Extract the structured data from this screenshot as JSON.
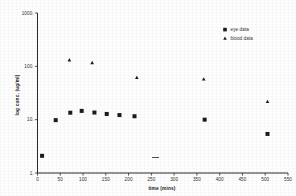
{
  "chart_data": {
    "type": "scatter",
    "title": "",
    "xlabel": "time (mins)",
    "ylabel": "log conc. (ug/ml)",
    "xlim": [
      0,
      550
    ],
    "ylim": [
      1,
      1000
    ],
    "yscale": "log",
    "grid": false,
    "legend_position": "top-right",
    "x_ticks": [
      0,
      50,
      100,
      150,
      200,
      250,
      300,
      350,
      400,
      450,
      500,
      550
    ],
    "x_tick_labels": [
      "0",
      "50",
      "100",
      "150",
      "200",
      "250",
      "300",
      "350",
      "400",
      "450",
      "500",
      "550"
    ],
    "y_ticks": [
      1,
      10,
      100,
      1000
    ],
    "y_tick_labels": [
      "1.",
      "10.",
      "100.",
      "1000."
    ],
    "series": [
      {
        "name": "eye data",
        "marker": "square",
        "color": "#1c1c1c",
        "points": [
          {
            "x": 10,
            "y": 2.1
          },
          {
            "x": 40,
            "y": 9.8
          },
          {
            "x": 72,
            "y": 13.5
          },
          {
            "x": 97,
            "y": 14.6
          },
          {
            "x": 125,
            "y": 13.6
          },
          {
            "x": 152,
            "y": 12.8
          },
          {
            "x": 180,
            "y": 12.2
          },
          {
            "x": 213,
            "y": 11.6
          },
          {
            "x": 367,
            "y": 10.0
          },
          {
            "x": 505,
            "y": 5.4
          }
        ]
      },
      {
        "name": "blood data",
        "marker": "triangle",
        "color": "#1c1c1c",
        "points": [
          {
            "x": 70,
            "y": 133
          },
          {
            "x": 120,
            "y": 118
          },
          {
            "x": 218,
            "y": 62
          },
          {
            "x": 365,
            "y": 58
          },
          {
            "x": 505,
            "y": 22
          }
        ]
      }
    ]
  },
  "legend": {
    "entries": [
      {
        "label": "eye data",
        "marker": "square-marker-icon"
      },
      {
        "label": "blood data",
        "marker": "triangle-marker-icon"
      }
    ]
  }
}
